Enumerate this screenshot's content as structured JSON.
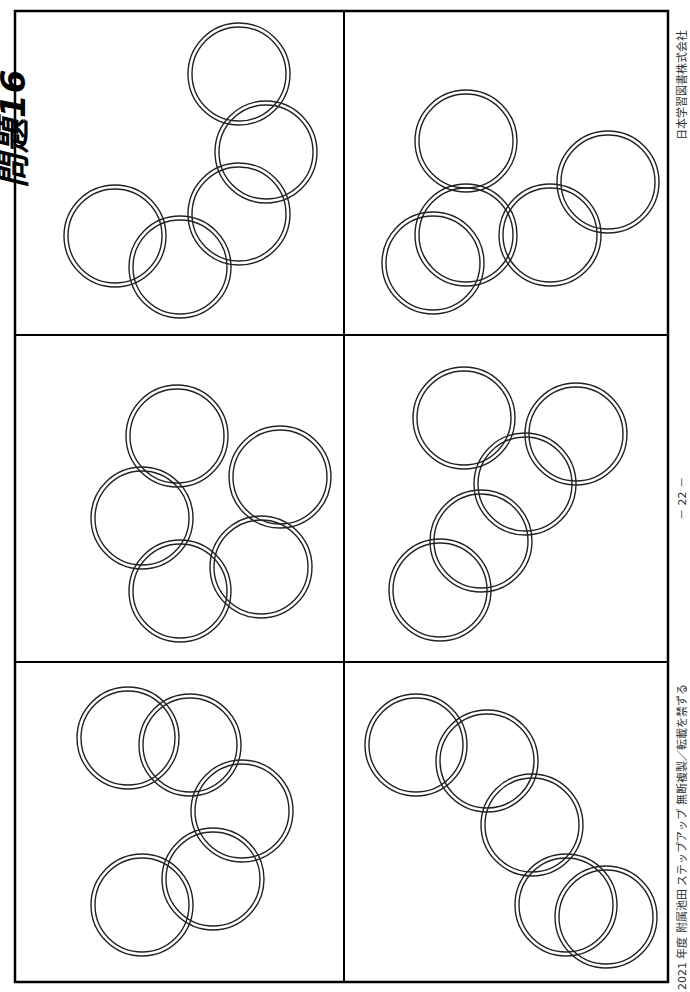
{
  "page": {
    "title": "問題16",
    "footer_left": "2021 年度  附属池田  ステップアップ  無断複製／転載を禁ずる",
    "page_number": "－ 22 －",
    "footer_right": "日本学習図書株式会社"
  },
  "style": {
    "border_color": "#000000",
    "ring_color": "#222222",
    "ring_outer_radius": 51,
    "ring_inner_radius": 47
  },
  "grid": {
    "left": 15,
    "top": 11,
    "right": 668,
    "bottom": 982,
    "col_divider_x": 344,
    "row_divider_y": [
      335,
      662
    ]
  },
  "panels": [
    {
      "id": "panel-1",
      "rings": [
        [
          239,
          74
        ],
        [
          266,
          152
        ],
        [
          239,
          214
        ],
        [
          115,
          236
        ],
        [
          180,
          267
        ]
      ]
    },
    {
      "id": "panel-2",
      "rings": [
        [
          466,
          141
        ],
        [
          466,
          235
        ],
        [
          433,
          263
        ],
        [
          550,
          235
        ],
        [
          608,
          182
        ]
      ]
    },
    {
      "id": "panel-3",
      "rings": [
        [
          177,
          436
        ],
        [
          142,
          518
        ],
        [
          180,
          591
        ],
        [
          280,
          477
        ],
        [
          261,
          567
        ]
      ]
    },
    {
      "id": "panel-4",
      "rings": [
        [
          464,
          418
        ],
        [
          576,
          434
        ],
        [
          525,
          484
        ],
        [
          481,
          541
        ],
        [
          440,
          590
        ]
      ]
    },
    {
      "id": "panel-5",
      "rings": [
        [
          128,
          738
        ],
        [
          190,
          745
        ],
        [
          242,
          811
        ],
        [
          213,
          879
        ],
        [
          142,
          905
        ]
      ]
    },
    {
      "id": "panel-6",
      "rings": [
        [
          416,
          745
        ],
        [
          487,
          761
        ],
        [
          532,
          825
        ],
        [
          566,
          905
        ],
        [
          606,
          917
        ]
      ]
    }
  ]
}
